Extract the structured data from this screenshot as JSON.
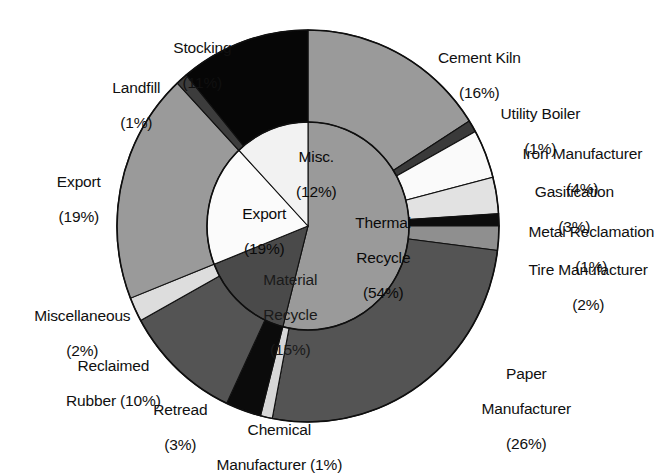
{
  "figure": {
    "kind": "nested-pie-chart",
    "background": "#ffffff",
    "geometry": {
      "center_x": 308,
      "center_y": 226,
      "outer_rx": 191,
      "outer_ry": 196,
      "inner_rx": 101,
      "inner_ry": 104,
      "start_angle_deg": -90
    }
  },
  "chart_data": {
    "type": "pie",
    "title": "",
    "subtitle": "",
    "xlabel": "",
    "ylabel": "",
    "legend_position": "none",
    "grid": false,
    "units": "percent",
    "rings": [
      {
        "name": "inner",
        "slices": [
          {
            "label": "Thermal Recycle",
            "pct_text": "(54%)",
            "value": 54,
            "fill": "#9a9a9a"
          },
          {
            "label": "Material Recycle",
            "pct_text": "(15%)",
            "value": 15,
            "fill": "#4a4a4a"
          },
          {
            "label": "Export",
            "pct_text": "(19%)",
            "value": 19,
            "fill": "#fbfbfb"
          },
          {
            "label": "Misc.",
            "pct_text": "(12%)",
            "value": 12,
            "fill": "#f2f2f2"
          }
        ]
      },
      {
        "name": "outer",
        "slices": [
          {
            "label": "Cement Kiln",
            "pct_text": "(16%)",
            "value": 16,
            "fill": "#9a9a9a"
          },
          {
            "label": "Utility Boiler",
            "pct_text": "(1%)",
            "value": 1,
            "fill": "#3a3a3a"
          },
          {
            "label": "Iron Manufacturer",
            "pct_text": "(4%)",
            "value": 4,
            "fill": "#fafafa"
          },
          {
            "label": "Gasification",
            "pct_text": "(3%)",
            "value": 3,
            "fill": "#e2e2e2"
          },
          {
            "label": "Metal Reclamation",
            "pct_text": "(1%)",
            "value": 1,
            "fill": "#0d0d0d"
          },
          {
            "label": "Tire Manufacturer",
            "pct_text": "(2%)",
            "value": 2,
            "fill": "#8f8f8f"
          },
          {
            "label": "Paper Manufacturer",
            "pct_text": "(26%)",
            "value": 26,
            "fill": "#545454"
          },
          {
            "label": "Chemical Manufacturer",
            "pct_text": "(1%)",
            "value": 1,
            "fill": "#d6d6d6"
          },
          {
            "label": "Retread",
            "pct_text": "(3%)",
            "value": 3,
            "fill": "#0b0b0b"
          },
          {
            "label": "Reclaimed Rubber",
            "pct_text": "(10%)",
            "value": 10,
            "fill": "#545454"
          },
          {
            "label": "Miscellaneous",
            "pct_text": "(2%)",
            "value": 2,
            "fill": "#dddddd"
          },
          {
            "label": "Export",
            "pct_text": "(19%)",
            "value": 19,
            "fill": "#9a9a9a"
          },
          {
            "label": "Landfill",
            "pct_text": "(1%)",
            "value": 1,
            "fill": "#3c3c3c"
          },
          {
            "label": "Stocking",
            "pct_text": "(11%)",
            "value": 11,
            "fill": "#060606"
          }
        ]
      }
    ]
  },
  "callouts": [
    {
      "id": "stocking",
      "line1": "Stocking",
      "line2": "(11%)"
    },
    {
      "id": "landfill",
      "line1": "Landfill",
      "line2": "(1%)"
    },
    {
      "id": "export-outer",
      "line1": "Export",
      "line2": "(19%)"
    },
    {
      "id": "miscellaneous",
      "line1": "Miscellaneous",
      "line2": "(2%)"
    },
    {
      "id": "reclaimed-rubber",
      "line1": "Reclaimed",
      "line2": "Rubber (10%)"
    },
    {
      "id": "retread",
      "line1": "Retread",
      "line2": "(3%)"
    },
    {
      "id": "chemical-manufacturer",
      "line1": "Chemical",
      "line2": "Manufacturer (1%)"
    },
    {
      "id": "paper-manufacturer",
      "line1": "Paper",
      "line2": "Manufacturer",
      "line3": "(26%)"
    },
    {
      "id": "tire-manufacturer",
      "line1": "Tire Manufacturer",
      "line2": "(2%)"
    },
    {
      "id": "metal-reclamation",
      "line1": "Metal Reclamation",
      "line2": "(1%)"
    },
    {
      "id": "gasification",
      "line1": "Gasification",
      "line2": "(3%)"
    },
    {
      "id": "iron-manufacturer",
      "line1": "Iron Manufacturer",
      "line2": "(4%)"
    },
    {
      "id": "utility-boiler",
      "line1": "Utility Boiler",
      "line2": "(1%)"
    },
    {
      "id": "cement-kiln",
      "line1": "Cement Kiln",
      "line2": "(16%)"
    }
  ],
  "inner_labels": [
    {
      "id": "misc",
      "line1": "Misc.",
      "line2": "(12%)"
    },
    {
      "id": "export-inner",
      "line1": "Export",
      "line2": "(19%)"
    },
    {
      "id": "material-recycle",
      "line1": "Material",
      "line2": "Recycle",
      "line3": "(15%)"
    },
    {
      "id": "thermal-recycle",
      "line1": "Thermal",
      "line2": "Recycle",
      "line3": "(54%)"
    }
  ]
}
